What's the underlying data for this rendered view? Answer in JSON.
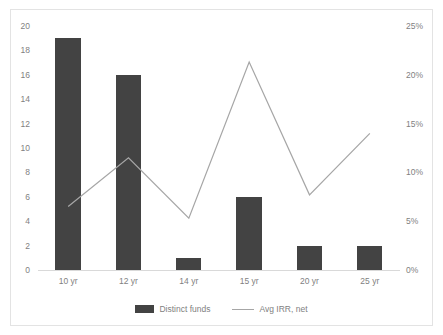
{
  "chart_data": {
    "type": "bar",
    "title": "",
    "subtitle": "",
    "xlabel": "",
    "ylabel": "",
    "categories": [
      "10 yr",
      "12 yr",
      "14 yr",
      "15 yr",
      "20 yr",
      "25 yr"
    ],
    "series": [
      {
        "name": "Distinct funds",
        "type": "bar",
        "axis": "left",
        "color": "#434343",
        "values": [
          19,
          16,
          1,
          6,
          2,
          2
        ]
      },
      {
        "name": "Avg IRR, net",
        "type": "line",
        "axis": "right",
        "color": "#a6a6a6",
        "values": [
          6.5,
          11.5,
          5.3,
          21.3,
          7.7,
          14.0
        ]
      }
    ],
    "left_axis": {
      "ticks": [
        "0",
        "2",
        "4",
        "6",
        "8",
        "10",
        "12",
        "14",
        "16",
        "18",
        "20"
      ],
      "values": [
        0,
        2,
        4,
        6,
        8,
        10,
        12,
        14,
        16,
        18,
        20
      ],
      "min": 0,
      "max": 20
    },
    "right_axis": {
      "ticks": [
        "0%",
        "5%",
        "10%",
        "15%",
        "20%",
        "25%"
      ],
      "values": [
        0,
        5,
        10,
        15,
        20,
        25
      ],
      "min": 0,
      "max": 25
    },
    "legend": {
      "position": "bottom",
      "entries": [
        {
          "label": "Distinct funds",
          "marker": "bar-swatch"
        },
        {
          "label": "Avg IRR, net",
          "marker": "line-swatch"
        }
      ]
    },
    "grid": false,
    "colors": {
      "bar": "#434343",
      "line": "#a6a6a6",
      "axis_text": "#7f7f7f",
      "axis_line": "#d9d9d9",
      "border": "#e3e3e3",
      "background": "#ffffff"
    }
  }
}
